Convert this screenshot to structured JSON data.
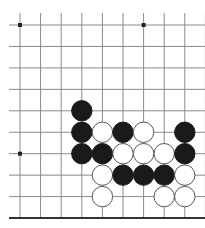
{
  "board": {
    "cols": 10,
    "rows": 10,
    "x0": 20,
    "dx": 20.6,
    "y0": 25,
    "dy": 21.45,
    "line_start_x": 9,
    "line_end_x": 205,
    "line_start_y": 13,
    "line_end_y": 218,
    "bottom_edge": true,
    "line_color": "#8a8a8a",
    "edge_color": "#333333",
    "star_points": [
      [
        0,
        0
      ],
      [
        6,
        0
      ],
      [
        0,
        6
      ]
    ],
    "stone_radius": 10.2
  },
  "stones": [
    {
      "color": "black",
      "col": 3,
      "row": 4
    },
    {
      "color": "black",
      "col": 3,
      "row": 5
    },
    {
      "color": "white",
      "col": 4,
      "row": 5
    },
    {
      "color": "black",
      "col": 5,
      "row": 5
    },
    {
      "color": "white",
      "col": 6,
      "row": 5
    },
    {
      "color": "black",
      "col": 8,
      "row": 5
    },
    {
      "color": "black",
      "col": 3,
      "row": 6
    },
    {
      "color": "black",
      "col": 4,
      "row": 6
    },
    {
      "color": "white",
      "col": 5,
      "row": 6
    },
    {
      "color": "white",
      "col": 6,
      "row": 6
    },
    {
      "color": "white",
      "col": 7,
      "row": 6
    },
    {
      "color": "black",
      "col": 8,
      "row": 6
    },
    {
      "color": "white",
      "col": 4,
      "row": 7
    },
    {
      "color": "black",
      "col": 5,
      "row": 7
    },
    {
      "color": "black",
      "col": 6,
      "row": 7
    },
    {
      "color": "black",
      "col": 7,
      "row": 7
    },
    {
      "color": "white",
      "col": 8,
      "row": 7
    },
    {
      "color": "white",
      "col": 4,
      "row": 8
    },
    {
      "color": "white",
      "col": 7,
      "row": 8
    },
    {
      "color": "white",
      "col": 8,
      "row": 8
    }
  ]
}
